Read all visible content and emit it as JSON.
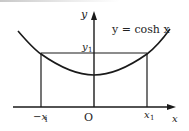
{
  "diagram": {
    "function_label": "y = cosh x",
    "axes": {
      "x_label": "x",
      "y_label": "y",
      "origin_label": "O"
    },
    "marks": {
      "neg_x1": "−x",
      "pos_x1": "x",
      "y1": "y",
      "subscript": "1"
    },
    "colors": {
      "line": "#1a1a1a",
      "background": "#ffffff"
    }
  }
}
